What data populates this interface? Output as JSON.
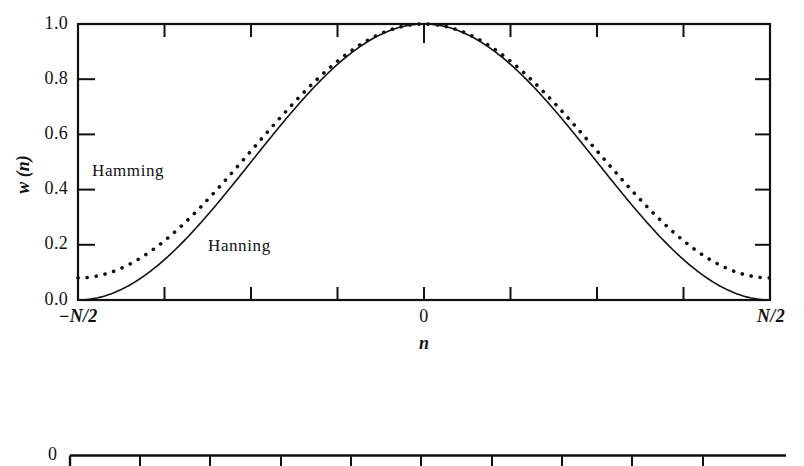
{
  "figure": {
    "background": "#ffffff",
    "ink": "#111111"
  },
  "chart_data": {
    "type": "line",
    "title": "",
    "xlabel": "n",
    "ylabel": "w (n)",
    "xlim": [
      -0.5,
      0.5
    ],
    "ylim": [
      0.0,
      1.0
    ],
    "grid": false,
    "legend": "inline-annotations",
    "x_tick_labels": [
      "-N/2",
      "0",
      "N/2"
    ],
    "x_tick_label_positions": [
      -0.5,
      0.0,
      0.5
    ],
    "x_minor_tick_count": 8,
    "y_tick_labels": [
      "0.0",
      "0.2",
      "0.4",
      "0.6",
      "0.8",
      "1.0"
    ],
    "y_tick_values": [
      0.0,
      0.2,
      0.4,
      0.6,
      0.8,
      1.0
    ],
    "annotations": [
      {
        "text": "Hamming",
        "x": -0.3,
        "y": 0.46
      },
      {
        "text": "Hanning",
        "x": -0.11,
        "y": 0.19
      }
    ],
    "series": [
      {
        "name": "Hamming",
        "style": "dotted",
        "formula": "0.54 + 0.46*cos(2*pi*n/N)",
        "x": [
          -0.5,
          -0.46875,
          -0.4375,
          -0.40625,
          -0.375,
          -0.34375,
          -0.3125,
          -0.28125,
          -0.25,
          -0.21875,
          -0.1875,
          -0.15625,
          -0.125,
          -0.09375,
          -0.0625,
          -0.03125,
          0.0,
          0.03125,
          0.0625,
          0.09375,
          0.125,
          0.15625,
          0.1875,
          0.21875,
          0.25,
          0.28125,
          0.3125,
          0.34375,
          0.375,
          0.40625,
          0.4375,
          0.46875,
          0.5
        ],
        "y": [
          0.08,
          0.084,
          0.098,
          0.12,
          0.151,
          0.191,
          0.238,
          0.292,
          0.351,
          0.414,
          0.48,
          0.548,
          0.616,
          0.683,
          0.747,
          0.807,
          0.862,
          0.807,
          0.747,
          0.683,
          0.616,
          0.548,
          0.48,
          0.414,
          0.351,
          0.292,
          0.238,
          0.191,
          0.151,
          0.12,
          0.098,
          0.084,
          0.08
        ]
      },
      {
        "name": "Hanning",
        "style": "solid",
        "formula": "0.5 + 0.5*cos(2*pi*n/N)",
        "x": [
          -0.5,
          -0.46875,
          -0.4375,
          -0.40625,
          -0.375,
          -0.34375,
          -0.3125,
          -0.28125,
          -0.25,
          -0.21875,
          -0.1875,
          -0.15625,
          -0.125,
          -0.09375,
          -0.0625,
          -0.03125,
          0.0,
          0.03125,
          0.0625,
          0.09375,
          0.125,
          0.15625,
          0.1875,
          0.21875,
          0.25,
          0.28125,
          0.3125,
          0.34375,
          0.375,
          0.40625,
          0.4375,
          0.46875,
          0.5
        ],
        "y": [
          0.0,
          0.005,
          0.019,
          0.043,
          0.076,
          0.117,
          0.167,
          0.223,
          0.285,
          0.352,
          0.422,
          0.494,
          0.566,
          0.637,
          0.705,
          0.769,
          0.827,
          0.769,
          0.705,
          0.637,
          0.566,
          0.494,
          0.422,
          0.352,
          0.285,
          0.223,
          0.167,
          0.117,
          0.076,
          0.043,
          0.019,
          0.005,
          0.0
        ]
      }
    ]
  },
  "axes": {
    "y_labels": [
      "1.0",
      "0.8",
      "0.6",
      "0.4",
      "0.2",
      "0.0"
    ],
    "x_label_left": "−N/2",
    "x_label_center": "0",
    "x_label_right": "N/2",
    "x_axis_title": "n",
    "y_axis_title": "w (n)"
  },
  "curve_labels": {
    "hamming": "Hamming",
    "hanning": "Hanning"
  },
  "second_plot": {
    "y_label_top": "0"
  }
}
